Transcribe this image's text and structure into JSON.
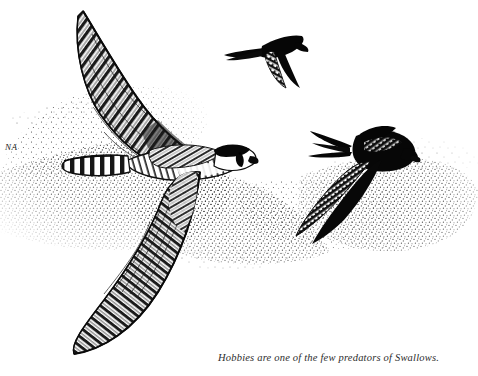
{
  "plate": {
    "title": "Hobby hunting Swallows and Swifts",
    "medium": "pen-and-ink stipple illustration",
    "background_color": "#ffffff",
    "ink_color": "#000000",
    "width": 478,
    "height": 376
  },
  "top_rule": {
    "name": "horizontal-rule",
    "color": "#3a3a3a",
    "x": 208,
    "y": 3,
    "width": 82
  },
  "signature": {
    "text": "NA",
    "x": 5,
    "y": 142
  },
  "caption": {
    "text": "Hobbies are one of the few predators of Swallows.",
    "x": 218,
    "y": 352,
    "style": "italic serif",
    "color": "#2c2c2c"
  },
  "subjects": [
    {
      "name": "hobby-falcon",
      "label": "Hobby",
      "role": "predator",
      "rendering": "detailed barred plumage, cross-hatched line work",
      "features": [
        "raised left wing with barred flight feathers",
        "lowered right wing sweeping down-left",
        "barred tail pointing left",
        "dark hood with moustachial stripe",
        "pale throat and cheek",
        "hooked beak facing right"
      ],
      "position": "left of plate, wings spanning top-left to bottom-left"
    },
    {
      "name": "swift",
      "label": "Swift",
      "role": "prey",
      "rendering": "near-solid black silhouette with stippled underwing",
      "features": [
        "scythe-shaped swept wings",
        "short notched tail",
        "compact dark body"
      ],
      "position": "upper centre-right of plate"
    },
    {
      "name": "swallow",
      "label": "Swallow",
      "role": "prey",
      "rendering": "solid black body with stippled inner wing",
      "features": [
        "deeply forked tail with long streamers",
        "wing angled down-left",
        "dark glossy back",
        "short bill facing right"
      ],
      "position": "right of plate, below the swift"
    }
  ],
  "background_texture": {
    "name": "stipple-cloud",
    "description": "soft stippled dot cloud suggesting sky and haze behind the birds",
    "color": "#111111"
  }
}
